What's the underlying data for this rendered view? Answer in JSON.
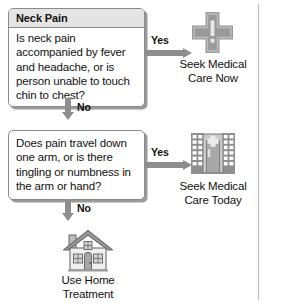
{
  "flowchart": {
    "title": "Neck Pain",
    "nodes": {
      "question1": {
        "header": "Neck Pain",
        "text": "Is neck pain accompanied by fever and headache, or is person unable to touch chin to chest?"
      },
      "question2": {
        "text": "Does pain travel down one arm, or is there tingling or numbness in the arm or hand?"
      },
      "outcome1": {
        "icon": "medical-cross-icon",
        "label": "Seek Medical\nCare Now"
      },
      "outcome2": {
        "icon": "clinic-building-icon",
        "label": "Seek Medical\nCare Today"
      },
      "outcome3": {
        "icon": "house-icon",
        "label": "Use Home\nTreatment"
      }
    },
    "edges": {
      "q1_yes": "Yes",
      "q1_no": "No",
      "q2_yes": "Yes",
      "q2_no": "No"
    }
  },
  "colors": {
    "arrow": "#8e8e8e",
    "icon_fill": "#9a9a9a",
    "icon_light": "#d6d6d6",
    "box_border": "#8a8a8a",
    "header_bg": "#e4e4e4",
    "rule": "#b9b9b9"
  }
}
